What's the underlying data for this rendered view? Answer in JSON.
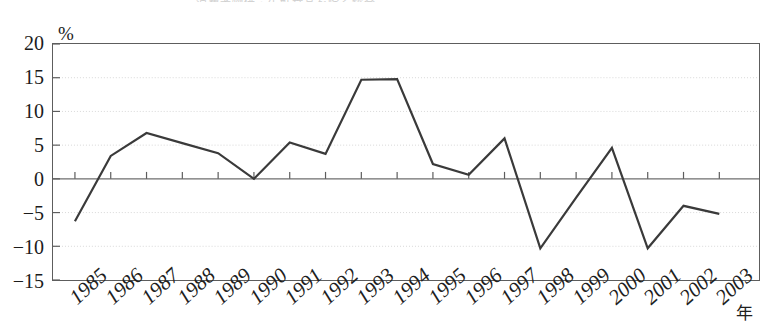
{
  "title_sliver": "消費者物価・生鮮食品を除く総合",
  "axis": {
    "y_unit": "%",
    "y_ticks": [
      20,
      15,
      10,
      5,
      0,
      -5,
      -10,
      -15
    ],
    "y_tick_labels": [
      "20",
      "15",
      "10",
      "5",
      "0",
      "−5",
      "−10",
      "−15"
    ],
    "x_axis_name": "年",
    "x_tick_labels": [
      "1985",
      "1986",
      "1987",
      "1988",
      "1989",
      "1990",
      "1991",
      "1992",
      "1993",
      "1994",
      "1995",
      "1996",
      "1997",
      "1998",
      "1999",
      "2000",
      "2001",
      "2002",
      "2003"
    ]
  },
  "style": {
    "line_color": "#3a3a3a",
    "frame_color": "#5d5d5d",
    "grid_color": "#d8d8d8",
    "zero_line_color": "#6e6e6e",
    "background": "#ffffff"
  },
  "chart_data": {
    "type": "line",
    "title": "消費者物価・生鮮食品を除く総合",
    "xlabel": "年",
    "ylabel": "%",
    "ylim": [
      -15,
      20
    ],
    "yticks": [
      20,
      15,
      10,
      5,
      0,
      -5,
      -10,
      -15
    ],
    "grid": true,
    "legend": "none",
    "x": [
      1985,
      1986,
      1987,
      1988,
      1989,
      1990,
      1991,
      1992,
      1993,
      1994,
      1995,
      1996,
      1997,
      1998,
      1999,
      2000,
      2001,
      2002,
      2003
    ],
    "values": [
      -6.3,
      3.4,
      6.8,
      5.3,
      3.8,
      0.0,
      5.4,
      3.7,
      14.7,
      14.8,
      2.2,
      0.6,
      6.0,
      -10.3,
      -2.8,
      4.6,
      -10.3,
      -4.0,
      -5.2
    ],
    "series": [
      {
        "name": "series-1",
        "values": [
          -6.3,
          3.4,
          6.8,
          5.3,
          3.8,
          0.0,
          5.4,
          3.7,
          14.7,
          14.8,
          2.2,
          0.6,
          6.0,
          -10.3,
          -2.8,
          4.6,
          -10.3,
          -4.0,
          -5.2
        ]
      }
    ],
    "note": "final plotted point corresponds to 2003 at approximately -8.0"
  }
}
